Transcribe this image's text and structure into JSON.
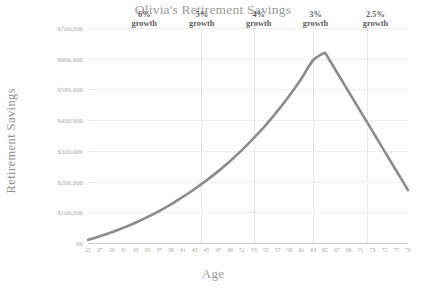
{
  "chart_data": {
    "type": "line",
    "title": "Olivia's Retirement Savings",
    "xlabel": "Age",
    "ylabel": "Retirement Savings",
    "xlim": [
      25,
      79
    ],
    "ylim": [
      0,
      700000
    ],
    "grid": true,
    "legend": "none",
    "line_color": "#8c8c8c",
    "gridline_color": "#e2e2e2",
    "divider_color": "#d8d8d8",
    "y_ticks": [
      "$0",
      "$100,000",
      "$200,000",
      "$300,000",
      "$400,000",
      "$500,000",
      "$600,000",
      "$700,000"
    ],
    "y_tick_values": [
      0,
      100000,
      200000,
      300000,
      400000,
      500000,
      600000,
      700000
    ],
    "x_ticks": [
      "25",
      "27",
      "29",
      "31",
      "33",
      "35",
      "37",
      "39",
      "41",
      "43",
      "45",
      "47",
      "49",
      "51",
      "53",
      "55",
      "57",
      "59",
      "61",
      "63",
      "65",
      "67",
      "69",
      "71",
      "73",
      "75",
      "77",
      "79"
    ],
    "x": [
      25,
      27,
      29,
      31,
      33,
      35,
      37,
      39,
      41,
      43,
      45,
      47,
      49,
      51,
      53,
      55,
      57,
      59,
      61,
      63,
      65,
      67,
      69,
      71,
      73,
      75,
      77,
      79
    ],
    "values": [
      10000,
      22000,
      35000,
      50000,
      66000,
      84000,
      104000,
      126000,
      150000,
      176000,
      204000,
      234000,
      267000,
      303000,
      342000,
      384000,
      430000,
      480000,
      535000,
      595000,
      620000,
      556000,
      492000,
      428000,
      364000,
      300000,
      236000,
      172000
    ],
    "annotations": [
      {
        "label_line1": "6%",
        "label_line2": "growth",
        "x_center": 34.5,
        "start": 25,
        "end": 44
      },
      {
        "label_line1": "5%",
        "label_line2": "growth",
        "x_center": 44.2,
        "start": 44,
        "end": 53
      },
      {
        "label_line1": "4%",
        "label_line2": "growth",
        "x_center": 53.8,
        "start": 53,
        "end": 63
      },
      {
        "label_line1": "3%",
        "label_line2": "growth",
        "x_center": 63.4,
        "start": 63,
        "end": 72
      },
      {
        "label_line1": "2.5%",
        "label_line2": "growth",
        "x_center": 73.5,
        "start": 72,
        "end": 79
      }
    ],
    "segment_dividers": [
      44,
      53,
      63,
      72
    ]
  }
}
